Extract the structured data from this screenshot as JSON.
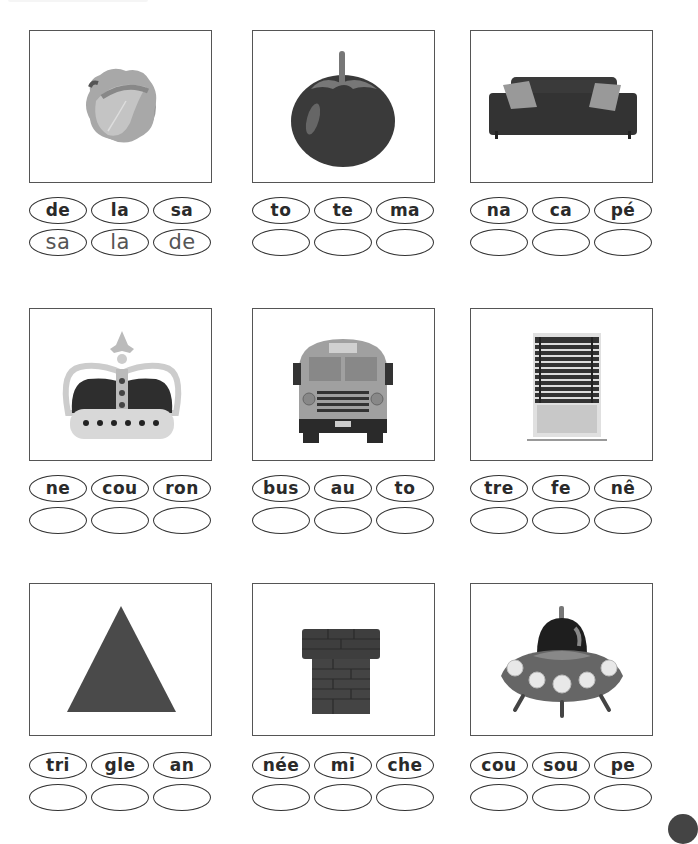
{
  "worksheet": {
    "items": [
      {
        "picture": "cabbage",
        "syllables": [
          "de",
          "la",
          "sa"
        ],
        "answer": [
          "sa",
          "la",
          "de"
        ]
      },
      {
        "picture": "tomato",
        "syllables": [
          "to",
          "te",
          "ma"
        ],
        "answer": [
          "",
          "",
          ""
        ]
      },
      {
        "picture": "sofa",
        "syllables": [
          "na",
          "ca",
          "pé"
        ],
        "answer": [
          "",
          "",
          ""
        ]
      },
      {
        "picture": "crown",
        "syllables": [
          "ne",
          "cou",
          "ron"
        ],
        "answer": [
          "",
          "",
          ""
        ]
      },
      {
        "picture": "school-bus",
        "syllables": [
          "bus",
          "au",
          "to"
        ],
        "answer": [
          "",
          "",
          ""
        ]
      },
      {
        "picture": "window",
        "syllables": [
          "tre",
          "fe",
          "nê"
        ],
        "answer": [
          "",
          "",
          ""
        ]
      },
      {
        "picture": "triangle",
        "syllables": [
          "tri",
          "gle",
          "an"
        ],
        "answer": [
          "",
          "",
          ""
        ]
      },
      {
        "picture": "chimney",
        "syllables": [
          "née",
          "mi",
          "che"
        ],
        "answer": [
          "",
          "",
          ""
        ]
      },
      {
        "picture": "flying-saucer",
        "syllables": [
          "cou",
          "sou",
          "pe"
        ],
        "answer": [
          "",
          "",
          ""
        ]
      }
    ]
  },
  "colors": {
    "frame_border": "#555555",
    "oval_border": "#333333",
    "text": "#2a2a2a"
  }
}
